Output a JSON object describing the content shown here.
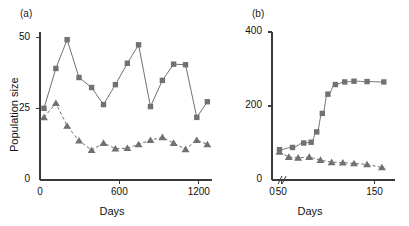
{
  "figure": {
    "background": "#ffffff",
    "marker_color": "#6e7275",
    "line_color": "#6e7275",
    "axis_color": "#3a3a3a",
    "text_color": "#111111"
  },
  "panels": [
    {
      "id": "a",
      "label": "(a)",
      "ylabel": "Population size",
      "xlabel": "Days",
      "y_ticks": [
        "0",
        "25",
        "50"
      ],
      "x_ticks": [
        "0",
        "600",
        "1200"
      ]
    },
    {
      "id": "b",
      "label": "(b)",
      "ylabel": "",
      "xlabel": "Days",
      "y_ticks": [
        "0",
        "200",
        "400"
      ],
      "x_ticks": [
        "0",
        "50",
        "150"
      ],
      "axis_break": "//"
    }
  ],
  "chart_data": [
    {
      "type": "line",
      "panel": "(a)",
      "title": "",
      "xlabel": "Days",
      "ylabel": "Population size",
      "xlim": [
        0,
        1300
      ],
      "ylim": [
        0,
        52
      ],
      "xticks": [
        0,
        600,
        1200
      ],
      "yticks": [
        0,
        25,
        50
      ],
      "grid": false,
      "legend": "none",
      "series": [
        {
          "name": "squares",
          "marker": "square",
          "linestyle": "solid",
          "color": "#6e7275",
          "x": [
            30,
            120,
            205,
            295,
            390,
            480,
            570,
            660,
            745,
            835,
            925,
            1010,
            1100,
            1185,
            1265
          ],
          "y": [
            25.2,
            39.2,
            49.3,
            36.0,
            32.5,
            26.5,
            33.5,
            41.0,
            47.5,
            25.8,
            35.0,
            40.7,
            40.5,
            22.0,
            27.5
          ]
        },
        {
          "name": "triangles",
          "marker": "triangle",
          "linestyle": "dashed",
          "color": "#6e7275",
          "x": [
            30,
            120,
            205,
            295,
            390,
            480,
            570,
            660,
            745,
            835,
            925,
            1010,
            1100,
            1185,
            1265
          ],
          "y": [
            22.0,
            27.0,
            19.0,
            13.8,
            10.5,
            13.0,
            11.0,
            11.2,
            12.5,
            14.0,
            15.0,
            13.0,
            10.8,
            14.0,
            12.5
          ]
        }
      ]
    },
    {
      "type": "line",
      "panel": "(b)",
      "title": "",
      "xlabel": "Days",
      "ylabel": "",
      "xlim": [
        40,
        172
      ],
      "ylim": [
        0,
        400
      ],
      "xticks": [
        50,
        150
      ],
      "yticks": [
        0,
        200,
        400
      ],
      "grid": false,
      "legend": "none",
      "axis_break": true,
      "series": [
        {
          "name": "squares",
          "marker": "square",
          "linestyle": "solid",
          "color": "#6e7275",
          "x": [
            48,
            62,
            74,
            82,
            88,
            94,
            100,
            108,
            118,
            128,
            142,
            160
          ],
          "y": [
            82,
            88,
            100,
            102,
            130,
            180,
            232,
            258,
            265,
            267,
            266,
            265
          ]
        },
        {
          "name": "triangles",
          "marker": "triangle",
          "linestyle": "dashed",
          "color": "#6e7275",
          "x": [
            48,
            58,
            68,
            80,
            92,
            104,
            116,
            128,
            142,
            158
          ],
          "y": [
            76,
            62,
            60,
            62,
            54,
            48,
            47,
            45,
            42,
            34
          ]
        }
      ]
    }
  ]
}
